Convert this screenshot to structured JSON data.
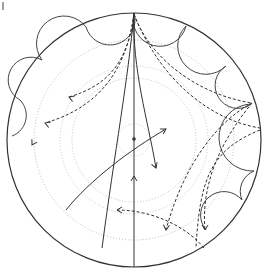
{
  "diagram": {
    "type": "poincare-disk",
    "disk": {
      "cx": 134,
      "cy": 140,
      "r": 127,
      "stroke": "#333333"
    },
    "center_point": {
      "cx": 134,
      "cy": 139,
      "r": 1.8
    },
    "dotted_circles": [
      {
        "r": 16,
        "color": "#c8c8c8"
      },
      {
        "r": 62,
        "color": "#b8b8b8"
      },
      {
        "r": 74,
        "color": "#c0c0c0"
      },
      {
        "r": 100,
        "color": "#b0b0b0"
      }
    ],
    "horocycle_arcs": [
      "M 42 60 A 22 22 0 0 0 20 100",
      "M 42 60 A 24 24 0 0 1 86 27",
      "M 86 27 A 22 22 0 0 0 134 13",
      "M 134 13 A 22 22 0 0 0 186 26",
      "M 186 26 A 22 22 0 0 0 226 66",
      "M 226 66 A 22 22 0 0 0 250 105",
      "M 251 104 A 22 22 0 0 0 254 171",
      "M 254 171 A 22 22 0 0 0 242 200",
      "M 242 200 A 18 18 0 0 0 206 230",
      "M 20 100 A 22 22 0 0 1 12 136"
    ],
    "solid_geodesics": [
      "M 134 13 L 134 267",
      "M 134 13 C 128 80, 115 150, 102 248",
      "M 134 13 C 132 70, 148 120, 156 168",
      "M 66 210 C 90 180, 130 150, 166 129"
    ],
    "dashed_curves": [
      "M 134 14 C 128 60, 110 85, 69 97",
      "M 134 14 C 125 80, 90 110, 45 123",
      "M 134 14 C 150 60, 200 95, 252 103",
      "M 134 14 C 160 80, 210 120, 260 128",
      "M 252 103 C 220 120, 185 160, 166 230",
      "M 252 103 C 230 130, 200 175, 205 230",
      "M 260 130 C 210 150, 200 180, 196 247",
      "M 204 248 C 185 225, 150 210, 117 210"
    ],
    "arrowheads": [
      {
        "x": 69,
        "y": 97,
        "angle": 200
      },
      {
        "x": 45,
        "y": 123,
        "angle": 200
      },
      {
        "x": 32,
        "y": 145,
        "angle": 120
      },
      {
        "x": 156,
        "y": 168,
        "angle": 70
      },
      {
        "x": 166,
        "y": 129,
        "angle": -30
      },
      {
        "x": 166,
        "y": 230,
        "angle": 95
      },
      {
        "x": 205,
        "y": 230,
        "angle": 90
      },
      {
        "x": 117,
        "y": 210,
        "angle": 180
      },
      {
        "x": 134,
        "y": 176,
        "angle": -90
      }
    ],
    "corner_mark": {
      "x": 3,
      "y1": 2,
      "y2": 10
    }
  }
}
